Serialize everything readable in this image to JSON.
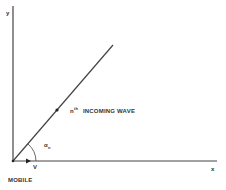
{
  "diagram": {
    "axes": {
      "x_label": "x",
      "y_label": "y"
    },
    "origin_label": "MOBILE",
    "velocity_label": "V",
    "wave": {
      "n": "n",
      "th": "th",
      "label": "INCOMING WAVE"
    },
    "angle": {
      "symbol": "α",
      "subscript": "n"
    },
    "colors": {
      "line": "#444444",
      "background": "#ffffff"
    }
  }
}
